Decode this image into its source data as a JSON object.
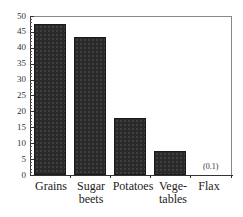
{
  "chart_data": {
    "type": "bar",
    "title": "",
    "xlabel": "",
    "ylabel": "",
    "categories": [
      "Grains",
      "Sugar beets",
      "Potatoes",
      "Vegetables",
      "Flax"
    ],
    "category_display": [
      [
        "Grains"
      ],
      [
        "Sugar",
        "beets"
      ],
      [
        "Potatoes"
      ],
      [
        "Vege-",
        "tables"
      ],
      [
        "Flax"
      ]
    ],
    "values": [
      47.5,
      43.5,
      18,
      7.5,
      0.1
    ],
    "ylim": [
      0,
      50
    ],
    "yticks": [
      0,
      5,
      10,
      15,
      20,
      25,
      30,
      35,
      40,
      45,
      50
    ],
    "annotations": [
      {
        "category": "Flax",
        "text": "(0.1)"
      }
    ],
    "grid": false,
    "legend": null,
    "bar_color": "#2a2a2a"
  },
  "labels": {
    "y": [
      "0",
      "5",
      "10",
      "15",
      "20",
      "25",
      "30",
      "35",
      "40",
      "45",
      "50"
    ],
    "x1": [
      "Grains",
      "Sugar",
      "Potatoes",
      "Vege-",
      "Flax"
    ],
    "x2": [
      "",
      "beets",
      "",
      "tables",
      ""
    ],
    "flax_annotation": "(0.1)"
  }
}
